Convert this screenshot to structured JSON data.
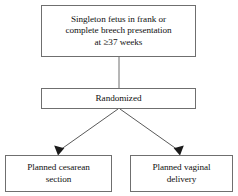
{
  "figure": {
    "type": "flowchart",
    "orientation": "top-to-bottom",
    "background_color": "#ffffff",
    "border_color": "#6f6f6f",
    "text_color": "#111111",
    "nodes": [
      {
        "id": "enrollment",
        "name": "eligibility-box",
        "text": "Singleton fetus in frank or\ncomplete breech presentation\nat ≥37 weeks",
        "lines": [
          "Singleton fetus in frank or",
          "complete breech presentation",
          "at ≥37 weeks"
        ]
      },
      {
        "id": "randomized",
        "name": "randomization-box",
        "text": "Randomized",
        "lines": [
          "Randomized"
        ]
      },
      {
        "id": "cesarean",
        "name": "planned-cesarean-arm-box",
        "text": "Planned cesarean\nsection",
        "lines": [
          "Planned cesarean",
          "section"
        ]
      },
      {
        "id": "vaginal",
        "name": "planned-vaginal-arm-box",
        "text": "Planned vaginal\ndelivery",
        "lines": [
          "Planned vaginal",
          "delivery"
        ]
      }
    ],
    "edges": [
      {
        "id": "enrollment-to-randomized",
        "from": "enrollment",
        "to": "randomized",
        "style": "plain-line",
        "arrowhead": false
      },
      {
        "id": "randomized-to-cesarean",
        "from": "randomized",
        "to": "cesarean",
        "style": "diagonal-arrow",
        "arrowhead": true
      },
      {
        "id": "randomized-to-vaginal",
        "from": "randomized",
        "to": "vaginal",
        "style": "diagonal-arrow",
        "arrowhead": true
      }
    ]
  }
}
